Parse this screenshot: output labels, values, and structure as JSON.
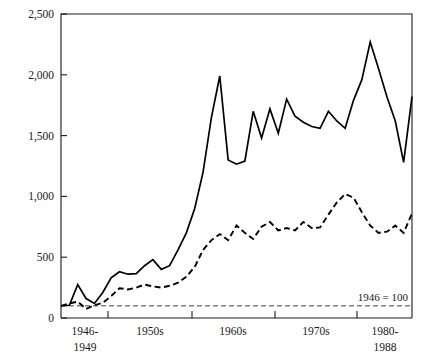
{
  "chart_data": {
    "type": "line",
    "title": "",
    "subtitle": "",
    "xlabel": "",
    "ylabel": "",
    "annotation": "1946 = 100",
    "baseline_value": 100,
    "grid": false,
    "legend_position": "none",
    "xlim": [
      1946,
      1988
    ],
    "ylim": [
      0,
      2500
    ],
    "y_ticks": [
      0,
      500,
      1000,
      1500,
      2000,
      2500
    ],
    "y_tick_labels": [
      "0",
      "500",
      "1,000",
      "1,500",
      "2,000",
      "2,500"
    ],
    "x_tick_labels": [
      "1946-\n1949",
      "1950s",
      "1960s",
      "1970s",
      "1980-\n1988"
    ],
    "x_tick_groups": [
      {
        "line1": "1946-",
        "line2": "1949"
      },
      {
        "line1": "1950s",
        "line2": ""
      },
      {
        "line1": "1960s",
        "line2": ""
      },
      {
        "line1": "1970s",
        "line2": ""
      },
      {
        "line1": "1980-",
        "line2": "1988"
      }
    ],
    "x": [
      1946,
      1947,
      1948,
      1949,
      1950,
      1951,
      1952,
      1953,
      1954,
      1955,
      1956,
      1957,
      1958,
      1959,
      1960,
      1961,
      1962,
      1963,
      1964,
      1965,
      1966,
      1967,
      1968,
      1969,
      1970,
      1971,
      1972,
      1973,
      1974,
      1975,
      1976,
      1977,
      1978,
      1979,
      1980,
      1981,
      1982,
      1983,
      1984,
      1985,
      1986,
      1987,
      1988
    ],
    "series": [
      {
        "name": "solid-series",
        "style": "solid",
        "values": [
          100,
          105,
          275,
          160,
          120,
          210,
          330,
          380,
          360,
          365,
          430,
          480,
          400,
          430,
          560,
          700,
          900,
          1200,
          1650,
          1990,
          1300,
          1265,
          1290,
          1700,
          1480,
          1720,
          1520,
          1800,
          1660,
          1610,
          1575,
          1560,
          1700,
          1620,
          1560,
          1790,
          1960,
          2270,
          2050,
          1820,
          1620,
          1280,
          1820
        ]
      },
      {
        "name": "dashed-series",
        "style": "dashed",
        "values": [
          100,
          120,
          135,
          75,
          105,
          125,
          180,
          245,
          235,
          250,
          275,
          260,
          250,
          265,
          290,
          340,
          420,
          560,
          640,
          690,
          640,
          760,
          700,
          650,
          750,
          790,
          720,
          740,
          720,
          790,
          740,
          745,
          850,
          950,
          1020,
          990,
          870,
          760,
          700,
          710,
          760,
          700,
          860
        ]
      }
    ]
  },
  "geometry": {
    "plot_left": 61,
    "plot_right": 412,
    "plot_top": 14,
    "plot_bottom": 318,
    "y_tick_pixels": [
      318,
      257.2,
      196.4,
      135.6,
      74.8,
      14
    ],
    "x_tick_pixels": [
      108,
      192,
      275,
      357
    ],
    "x_group_centers": [
      85,
      150,
      233,
      316,
      385
    ]
  },
  "colors": {
    "ink": "#000000",
    "axis": "#1a1a1a",
    "baseline": "#444444",
    "background": "#ffffff"
  }
}
